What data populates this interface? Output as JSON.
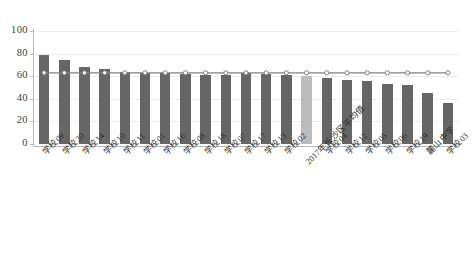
{
  "chart_data": {
    "type": "bar",
    "title": "",
    "subtitle": "",
    "xlabel": "",
    "ylabel": "",
    "ylim": [
      0,
      100
    ],
    "yticks": [
      0,
      20,
      40,
      60,
      80,
      100
    ],
    "ytick_labels": [
      "0",
      "20",
      "40",
      "60",
      "80",
      "100"
    ],
    "grid": true,
    "legend": "none",
    "categories": [
      "学校09",
      "学校20",
      "学校14",
      "学校10",
      "学校11",
      "学校01",
      "学校16",
      "学校08",
      "学校18",
      "学校07",
      "学校17",
      "学校13",
      "学校02",
      "2017年长沙区平均值",
      "学校04",
      "学校12",
      "学校05",
      "学校06",
      "学校19",
      "麓山中学",
      "学校03"
    ],
    "series": [
      {
        "name": "得分",
        "type": "bar",
        "color": "#666666",
        "highlight_color": "#bcbcbc",
        "highlight_index": 13,
        "values": [
          79,
          74,
          68,
          66,
          64,
          63,
          63,
          62,
          61,
          61,
          63,
          62,
          61,
          60,
          58,
          57,
          56,
          53,
          52,
          45,
          36
        ]
      },
      {
        "name": "平均线",
        "type": "line",
        "color": "#808080",
        "marker": "circle-open",
        "values": [
          63,
          63,
          63,
          63,
          63,
          63,
          63,
          63,
          63,
          63,
          63,
          63,
          63,
          63,
          63,
          63,
          63,
          63,
          63,
          63,
          63
        ]
      }
    ]
  }
}
